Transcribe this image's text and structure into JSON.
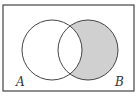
{
  "diagram": {
    "type": "venn",
    "sets": [
      {
        "label": "A",
        "cx": 52,
        "cy": 50,
        "r": 30
      },
      {
        "label": "B",
        "cx": 88,
        "cy": 50,
        "r": 30
      }
    ],
    "shaded_region": "B \\ A",
    "colors": {
      "shade": "#d0d0d0",
      "stroke": "#444444",
      "border": "#444444",
      "background": "#ffffff"
    }
  },
  "labels": {
    "a": "A",
    "b": "B"
  }
}
